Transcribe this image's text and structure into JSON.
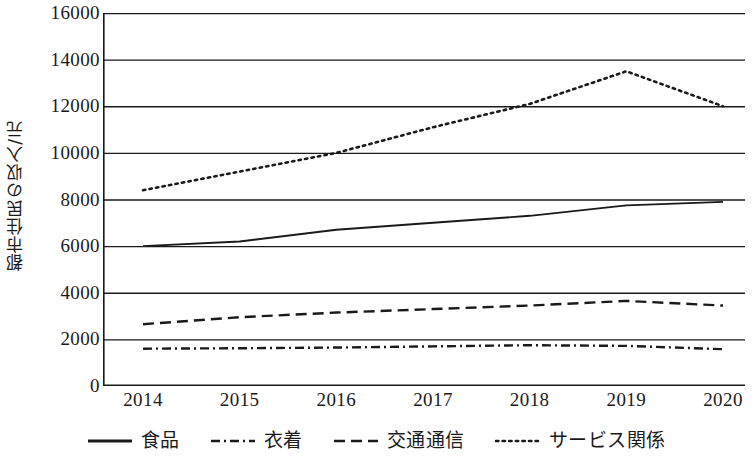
{
  "chart_data": {
    "type": "line",
    "title": "",
    "xlabel": "",
    "ylabel": "都市住民の収入/元",
    "x": [
      "2014",
      "2015",
      "2016",
      "2017",
      "2018",
      "2019",
      "2020"
    ],
    "categories": [
      "2014",
      "2015",
      "2016",
      "2017",
      "2018",
      "2019",
      "2020"
    ],
    "ylim": [
      0,
      16000
    ],
    "yticks": [
      0,
      2000,
      4000,
      6000,
      8000,
      10000,
      12000,
      14000,
      16000
    ],
    "ytick_labels": [
      "0",
      "2000",
      "4000",
      "6000",
      "8000",
      "10000",
      "12000",
      "14000",
      "16000"
    ],
    "grid": "horizontal",
    "legend_position": "bottom",
    "series": [
      {
        "name": "食品",
        "style": "solid",
        "color": "#1a1a1a",
        "values": [
          6000,
          6200,
          6700,
          7000,
          7300,
          7750,
          7900
        ]
      },
      {
        "name": "衣着",
        "style": "dash-dot",
        "color": "#1a1a1a",
        "values": [
          1600,
          1620,
          1650,
          1700,
          1750,
          1720,
          1580
        ]
      },
      {
        "name": "交通通信",
        "style": "dashed",
        "color": "#1a1a1a",
        "values": [
          2650,
          2950,
          3150,
          3300,
          3450,
          3650,
          3450
        ]
      },
      {
        "name": "サービス関係",
        "style": "dotted",
        "color": "#1a1a1a",
        "values": [
          8400,
          9200,
          10000,
          11100,
          12100,
          13500,
          12000
        ]
      }
    ]
  }
}
